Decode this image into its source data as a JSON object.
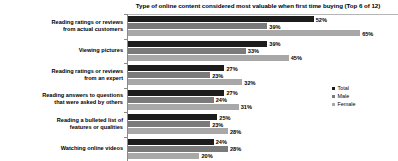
{
  "chart_data": {
    "type": "bar",
    "orientation": "horizontal",
    "title": "Type of online content considered most valuable when first time buying (Top 6 of 12)",
    "xlabel": "",
    "ylabel": "",
    "xlim": [
      0,
      70
    ],
    "grid": false,
    "legend_position": "right",
    "value_suffix": "%",
    "categories": [
      "Reading ratings or reviews from actual customers",
      "Viewing pictures",
      "Reading ratings or reviews from an expert",
      "Reading answers to questions that were asked by others",
      "Reading a bulleted list of features or qualities",
      "Watching online videos"
    ],
    "category_lines": [
      [
        "Reading ratings or reviews",
        "from actual customers"
      ],
      [
        "Viewing pictures"
      ],
      [
        "Reading ratings or reviews",
        "from an expert"
      ],
      [
        "Reading answers to questions",
        "that were asked by others"
      ],
      [
        "Reading a bulleted list of",
        "features or qualities"
      ],
      [
        "Watching online videos"
      ]
    ],
    "series": [
      {
        "name": "Total",
        "color": "#1c1c1c",
        "values": [
          52,
          39,
          27,
          27,
          25,
          24
        ],
        "labels": [
          "52%",
          "39%",
          "27%",
          "27%",
          "25%",
          "24%"
        ]
      },
      {
        "name": "Male",
        "color": "#7a7a7a",
        "values": [
          39,
          33,
          23,
          24,
          23,
          28
        ],
        "labels": [
          "39%",
          "33%",
          "23%",
          "24%",
          "23%",
          "28%"
        ]
      },
      {
        "name": "Female",
        "color": "#a8a8a8",
        "values": [
          65,
          45,
          32,
          31,
          28,
          20
        ],
        "labels": [
          "65%",
          "45%",
          "32%",
          "31%",
          "28%",
          "20%"
        ]
      }
    ]
  }
}
